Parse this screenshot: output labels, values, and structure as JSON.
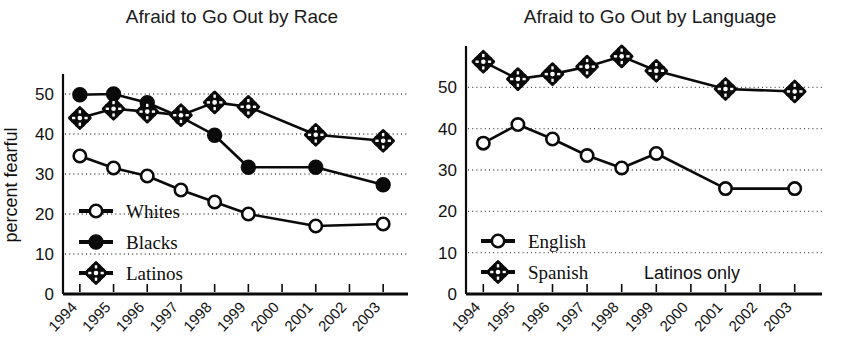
{
  "figure": {
    "panels": [
      "left",
      "right"
    ],
    "accent_color": "#0a0a0a",
    "background_color": "#ffffff",
    "gridline_color": "#4a4a4a"
  },
  "chart_data": [
    {
      "id": "afraid-by-race",
      "type": "line",
      "title": "Afraid to Go Out by Race",
      "xlabel": "",
      "ylabel": "percent fearful",
      "x": [
        "1994",
        "1995",
        "1996",
        "1997",
        "1998",
        "1999",
        "2001",
        "2003"
      ],
      "x_tick_labels": [
        "1994",
        "1995",
        "1996",
        "1997",
        "1998",
        "1999",
        "2000",
        "2001",
        "2002",
        "2003"
      ],
      "y_tick_labels": [
        "0",
        "10",
        "20",
        "30",
        "40",
        "50"
      ],
      "y_ticks": [
        0,
        10,
        20,
        30,
        40,
        50
      ],
      "ylim": [
        0,
        55
      ],
      "xlim": [
        1993.5,
        2003.5
      ],
      "grid": true,
      "legend_position": "lower-left",
      "series": [
        {
          "name": "Whites",
          "marker": "open-circle",
          "values": [
            34.5,
            31.5,
            29.5,
            26.0,
            23.0,
            20.0,
            17.0,
            17.5
          ]
        },
        {
          "name": "Blacks",
          "marker": "filled-circle",
          "values": [
            49.8,
            50.0,
            47.8,
            44.2,
            39.7,
            31.7,
            31.7,
            27.3
          ]
        },
        {
          "name": "Latinos",
          "marker": "cross-square",
          "values": [
            44.0,
            46.3,
            45.6,
            44.7,
            47.9,
            46.8,
            39.8,
            38.3
          ]
        }
      ]
    },
    {
      "id": "afraid-by-language",
      "type": "line",
      "title": "Afraid to Go Out by Language",
      "xlabel": "",
      "ylabel": "",
      "annotation": "Latinos only",
      "x": [
        "1994",
        "1995",
        "1996",
        "1997",
        "1998",
        "1999",
        "2001",
        "2003"
      ],
      "x_tick_labels": [
        "1994",
        "1995",
        "1996",
        "1997",
        "1998",
        "1999",
        "2000",
        "2001",
        "2002",
        "2003"
      ],
      "y_tick_labels": [
        "0",
        "10",
        "20",
        "30",
        "40",
        "50"
      ],
      "y_ticks": [
        0,
        10,
        20,
        30,
        40,
        50
      ],
      "ylim": [
        0,
        60
      ],
      "xlim": [
        1993.5,
        2003.5
      ],
      "grid": true,
      "legend_position": "lower-left",
      "series": [
        {
          "name": "English",
          "marker": "open-circle",
          "values": [
            36.5,
            41.0,
            37.5,
            33.5,
            30.5,
            34.0,
            25.5,
            25.5
          ]
        },
        {
          "name": "Spanish",
          "marker": "cross-square",
          "values": [
            56.2,
            52.0,
            53.2,
            55.0,
            57.5,
            54.0,
            49.6,
            49.0
          ]
        }
      ]
    }
  ]
}
